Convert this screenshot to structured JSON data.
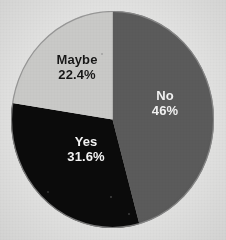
{
  "figure": {
    "background_color": "#e2e2e1",
    "outline_color": "#8d8d8d"
  },
  "chart_data": {
    "type": "pie",
    "title": "",
    "xlabel": "",
    "ylabel": "",
    "legend": "none",
    "grid": false,
    "start_angle_deg": 0,
    "direction": "clockwise",
    "categories": [
      "No",
      "Yes",
      "Maybe"
    ],
    "values": [
      46,
      31.6,
      22.4
    ],
    "labels": [
      "46%",
      "31.6%",
      "22.4%"
    ],
    "colors": [
      "#5b5b5b",
      "#0b0b0b",
      "#c9c9c7"
    ],
    "label_text_colors": [
      "#f2f2f2",
      "#f4f4f4",
      "#171717"
    ],
    "slices": [
      {
        "name": "No",
        "value": 46,
        "value_label": "46%",
        "color": "#5b5b5b",
        "text_color": "#f2f2f2",
        "start_deg": 0,
        "end_deg": 165.6
      },
      {
        "name": "Yes",
        "value": 31.6,
        "value_label": "31.6%",
        "color": "#0b0b0b",
        "text_color": "#f4f4f4",
        "start_deg": 165.6,
        "end_deg": 279.4
      },
      {
        "name": "Maybe",
        "value": 22.4,
        "value_label": "22.4%",
        "color": "#c9c9c7",
        "text_color": "#171717",
        "start_deg": 279.4,
        "end_deg": 360
      }
    ]
  }
}
